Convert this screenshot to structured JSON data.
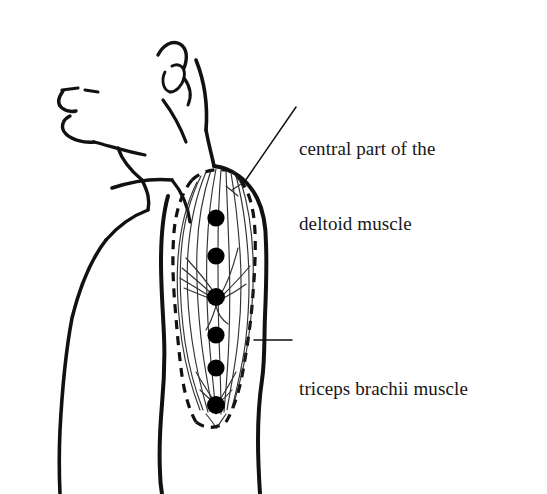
{
  "figure": {
    "kind": "anatomical-line-drawing",
    "background_color": "#ffffff",
    "ink_color": "#111111",
    "width": 547,
    "height": 494
  },
  "labels": {
    "deltoid": {
      "line1": "central part of the",
      "line2": "deltoid muscle"
    },
    "triceps": {
      "line1": "triceps brachii muscle"
    }
  },
  "markers": {
    "description": "filled black stimulation points along the arm",
    "count": 6,
    "diameter": 17,
    "color": "#000000",
    "points": [
      {
        "cx": 216,
        "cy": 218
      },
      {
        "cx": 216,
        "cy": 256
      },
      {
        "cx": 216,
        "cy": 297
      },
      {
        "cx": 216,
        "cy": 335
      },
      {
        "cx": 216,
        "cy": 368
      },
      {
        "cx": 216,
        "cy": 405
      }
    ]
  },
  "leaders": {
    "deltoid": {
      "x1": 296,
      "y1": 107,
      "x2": 243,
      "y2": 184
    },
    "triceps": {
      "x1": 292,
      "y1": 340,
      "x2": 254,
      "y2": 340
    }
  }
}
